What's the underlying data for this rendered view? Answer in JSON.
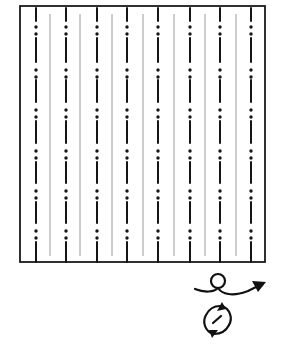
{
  "diagram": {
    "type": "knitting-stitch-chart",
    "frame": {
      "x": 20,
      "y": 6,
      "width": 245,
      "height": 256
    },
    "colors": {
      "ink": "#151515",
      "light_line": "#9a9a9a",
      "background": "#ffffff"
    },
    "dark_columns_x": [
      36,
      66,
      97,
      127,
      158,
      190,
      220,
      251
    ],
    "light_columns_x": [
      50,
      80,
      112,
      143,
      174,
      205,
      236
    ],
    "dot_pair_rows_y": [
      27,
      70,
      110,
      151,
      191,
      231
    ],
    "dot_spacing": 7,
    "dash_segments": [
      [
        8,
        21
      ],
      [
        38,
        62
      ],
      [
        80,
        102
      ],
      [
        121,
        143
      ],
      [
        162,
        183
      ],
      [
        202,
        223
      ],
      [
        242,
        262
      ]
    ],
    "legend": [
      {
        "symbol": "twisted-loop-arrow-icon",
        "meaning": "crossed / twisted stitch direction"
      },
      {
        "symbol": "circular-arrows-icon",
        "meaning": "rotate / twist"
      }
    ]
  }
}
